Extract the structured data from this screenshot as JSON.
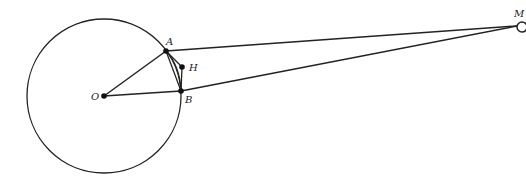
{
  "diagram": {
    "type": "geometry",
    "circle": {
      "center": "O",
      "cx": 104,
      "cy": 96,
      "r": 77
    },
    "points": [
      {
        "name": "O",
        "x": 104,
        "y": 96,
        "label": "O"
      },
      {
        "name": "A",
        "x": 166,
        "y": 51,
        "label": "A"
      },
      {
        "name": "B",
        "x": 181,
        "y": 91,
        "label": "B"
      },
      {
        "name": "H",
        "x": 182,
        "y": 67,
        "label": "H"
      },
      {
        "name": "M",
        "x": 522,
        "y": 24,
        "label": "M"
      }
    ],
    "segments": [
      "OA",
      "OB",
      "AB",
      "AH",
      "HB",
      "AM",
      "BM"
    ],
    "arcs": [
      "AB"
    ],
    "colors": {
      "stroke": "#222222",
      "background": "#ffffff"
    }
  }
}
